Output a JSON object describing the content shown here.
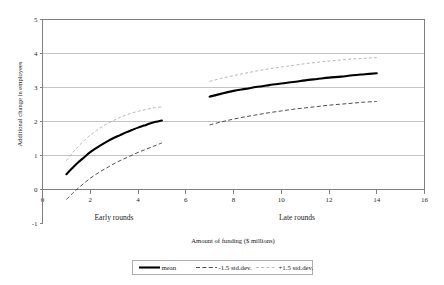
{
  "chart_data": {
    "type": "line",
    "title": "",
    "xlabel": "Amount of funding ($ millions)",
    "ylabel": "Additional change in employees",
    "xlim": [
      0,
      16
    ],
    "ylim": [
      -1,
      5
    ],
    "xticks": [
      0,
      2,
      4,
      6,
      8,
      10,
      12,
      14,
      16
    ],
    "yticks": [
      -1,
      0,
      1,
      2,
      3,
      4,
      5
    ],
    "xtick_labels": [
      "0",
      "2",
      "4",
      "6",
      "8",
      "10",
      "12",
      "14",
      "16"
    ],
    "ytick_labels": [
      "-1",
      "0",
      "1",
      "2",
      "3",
      "4",
      "5"
    ],
    "grid": "horizontal",
    "legend_position": "bottom-center",
    "legend": [
      "mean",
      "-1.5 std.dev.",
      "+1.5 std.dev."
    ],
    "annotations": [
      {
        "text": "Early rounds",
        "x": 3.0,
        "y": -0.55
      },
      {
        "text": "Late rounds",
        "x": 10.6,
        "y": -0.55
      }
    ],
    "groups": [
      {
        "name": "Early rounds",
        "x": [
          1.0,
          1.25,
          1.5,
          1.75,
          2.0,
          2.25,
          2.5,
          2.75,
          3.0,
          3.25,
          3.5,
          3.75,
          4.0,
          4.25,
          4.5,
          4.75,
          5.0
        ],
        "series": [
          {
            "name": "mean",
            "values": [
              0.45,
              0.63,
              0.8,
              0.95,
              1.1,
              1.22,
              1.33,
              1.43,
              1.52,
              1.6,
              1.68,
              1.75,
              1.82,
              1.88,
              1.94,
              1.99,
              2.03
            ]
          },
          {
            "name": "-1.5 std.dev.",
            "values": [
              -0.3,
              -0.12,
              0.04,
              0.19,
              0.33,
              0.45,
              0.56,
              0.66,
              0.76,
              0.85,
              0.93,
              1.01,
              1.09,
              1.16,
              1.23,
              1.3,
              1.37
            ]
          },
          {
            "name": "+1.5 std.dev.",
            "values": [
              0.85,
              1.07,
              1.27,
              1.44,
              1.6,
              1.73,
              1.85,
              1.95,
              2.04,
              2.12,
              2.19,
              2.25,
              2.3,
              2.34,
              2.38,
              2.41,
              2.43
            ]
          }
        ]
      },
      {
        "name": "Late rounds",
        "x": [
          7.0,
          7.5,
          8.0,
          8.5,
          9.0,
          9.5,
          10.0,
          10.5,
          11.0,
          11.5,
          12.0,
          12.5,
          13.0,
          13.5,
          14.0
        ],
        "series": [
          {
            "name": "mean",
            "values": [
              2.73,
              2.82,
              2.9,
              2.96,
              3.02,
              3.07,
              3.12,
              3.16,
              3.21,
              3.25,
              3.29,
              3.32,
              3.36,
              3.39,
              3.42
            ]
          },
          {
            "name": "-1.5 std.dev.",
            "values": [
              1.9,
              1.99,
              2.07,
              2.14,
              2.2,
              2.26,
              2.31,
              2.36,
              2.4,
              2.44,
              2.48,
              2.51,
              2.54,
              2.57,
              2.59
            ]
          },
          {
            "name": "+1.5 std.dev.",
            "values": [
              3.18,
              3.27,
              3.35,
              3.42,
              3.49,
              3.55,
              3.6,
              3.65,
              3.7,
              3.74,
              3.78,
              3.81,
              3.84,
              3.86,
              3.88
            ]
          }
        ]
      }
    ],
    "colors": {
      "mean": "#000000",
      "lower": "#3a3a3a",
      "upper": "#b0b0b0",
      "grid": "#b5b5b5",
      "axis": "#808080",
      "background": "#ffffff"
    }
  }
}
